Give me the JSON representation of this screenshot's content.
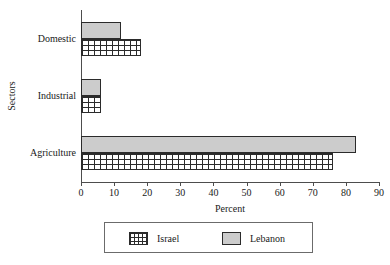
{
  "chart_data": {
    "type": "bar",
    "orientation": "horizontal",
    "title": "",
    "xlabel": "Percent",
    "ylabel": "Sectors",
    "categories": [
      "Domestic",
      "Industrial",
      "Agriculture"
    ],
    "xlim": [
      0,
      90
    ],
    "xticks": [
      0,
      10,
      20,
      30,
      40,
      50,
      60,
      70,
      80,
      90
    ],
    "xticklabels": [
      "0",
      "10",
      "20",
      "30",
      "40",
      "50",
      "60",
      "70",
      "80",
      "90"
    ],
    "grid": false,
    "legend_position": "bottom",
    "series": [
      {
        "name": "Israel",
        "pattern": "cross-hatch-grid",
        "color": "#ffffff",
        "edge_color": "#2b2b2b",
        "values": [
          18,
          6,
          76
        ]
      },
      {
        "name": "Lebanon",
        "pattern": "solid-gray",
        "color": "#cccccc",
        "edge_color": "#2b2b2b",
        "values": [
          12,
          6,
          83
        ]
      }
    ]
  },
  "legend": {
    "entries": [
      {
        "label": "Israel",
        "swatch": "crosshatch-swatch"
      },
      {
        "label": "Lebanon",
        "swatch": "gray-swatch"
      }
    ]
  },
  "axes": {
    "x_title": "Percent",
    "y_title": "Sectors"
  }
}
